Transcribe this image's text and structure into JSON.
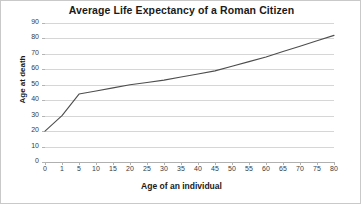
{
  "chart_data": {
    "type": "line",
    "title": "Average Life Expectancy of a Roman Citizen",
    "xlabel": "Age of an individual",
    "ylabel": "Age at death",
    "categories": [
      "0",
      "1",
      "5",
      "10",
      "15",
      "20",
      "25",
      "30",
      "35",
      "40",
      "45",
      "50",
      "55",
      "60",
      "65",
      "70",
      "75",
      "80"
    ],
    "values": [
      20,
      30,
      44,
      46,
      48,
      50,
      51.5,
      53,
      55,
      57,
      59,
      62,
      65,
      68,
      71.5,
      75,
      78.5,
      82
    ],
    "yticks": [
      "0",
      "10",
      "20",
      "30",
      "40",
      "50",
      "60",
      "70",
      "80",
      "90"
    ],
    "ylim": [
      0,
      90
    ],
    "grid": true,
    "legend": "none",
    "line_color": "#4d4d4d",
    "grid_color": "#d6d6d6",
    "background_color": "#ffffff"
  }
}
